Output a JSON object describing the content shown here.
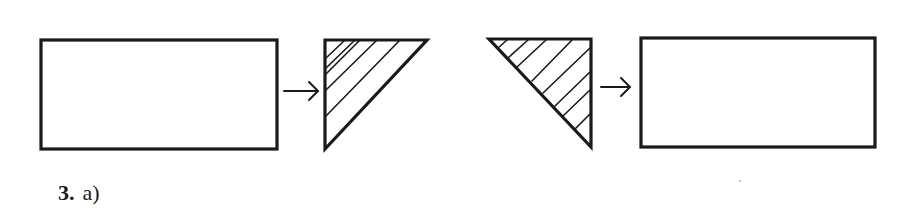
{
  "figure": {
    "caption": {
      "number": "3.",
      "part": "a)"
    },
    "colors": {
      "ink": "#1a1a1a",
      "background": "#ffffff"
    },
    "shapes": [
      {
        "id": "rect-left",
        "type": "rectangle",
        "x": 41,
        "y": 40,
        "width": 236,
        "height": 109,
        "hatched": false
      },
      {
        "id": "arrow-1",
        "type": "arrow",
        "from": [
          283,
          91
        ],
        "to": [
          318,
          91
        ],
        "glyph": "→"
      },
      {
        "id": "triangle-1",
        "type": "right-triangle",
        "points": [
          [
            325,
            40
          ],
          [
            427,
            40
          ],
          [
            325,
            149
          ]
        ],
        "right_angle": "top-left",
        "hatched": true
      },
      {
        "id": "triangle-2",
        "type": "right-triangle",
        "points": [
          [
            489,
            39
          ],
          [
            591,
            39
          ],
          [
            591,
            147
          ]
        ],
        "right_angle": "top-right",
        "hatched": true
      },
      {
        "id": "arrow-2",
        "type": "arrow",
        "from": [
          600,
          87
        ],
        "to": [
          630,
          87
        ],
        "glyph": "→"
      },
      {
        "id": "rect-right",
        "type": "rectangle",
        "x": 641,
        "y": 38,
        "width": 234,
        "height": 109,
        "hatched": false
      }
    ]
  }
}
